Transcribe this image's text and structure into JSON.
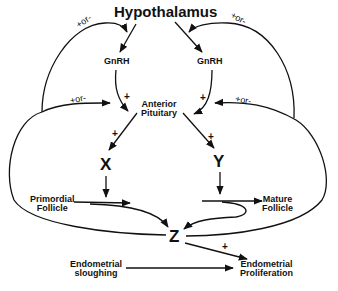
{
  "diagram": {
    "title": "Hypothalamus",
    "nodes": {
      "hypothalamus": "Hypothalamus",
      "gnrh_left": "GnRH",
      "gnrh_right": "GnRH",
      "anterior_pituitary_line1": "Anterior",
      "anterior_pituitary_line2": "Pituitary",
      "x": "X",
      "y": "Y",
      "z": "Z",
      "primordial_follicle_line1": "Primordial",
      "primordial_follicle_line2": "Follicle",
      "mature_follicle_line1": "Mature",
      "mature_follicle_line2": "Follicle",
      "endometrial_sloughing_line1": "Endometrial",
      "endometrial_sloughing_line2": "sloughing",
      "endometrial_proliferation_line1": "Endometrial",
      "endometrial_proliferation_line2": "Proliferation"
    },
    "edge_labels": {
      "gnrh_left_to_pituitary": "+",
      "gnrh_right_to_pituitary": "+",
      "pituitary_to_x": "+",
      "pituitary_to_y": "+",
      "z_to_proliferation": "+",
      "feedback_upper_left": "+or-",
      "feedback_upper_right": "+or-",
      "feedback_lower_left": "+or-",
      "feedback_lower_right": "+or-"
    },
    "colors": {
      "stroke": "#111111",
      "background": "#ffffff"
    }
  }
}
